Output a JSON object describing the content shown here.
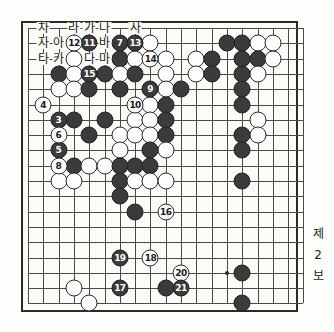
{
  "figure": {
    "caption_lines": [
      "제",
      "2",
      "보"
    ],
    "board": {
      "columns": 18,
      "rows": 19,
      "grid_spacing": 15.3,
      "origin_x": 28,
      "origin_y": 28,
      "star_points": [
        [
          13,
          16
        ]
      ]
    }
  },
  "colors": {
    "black_stone": "#3b3b3b",
    "white_stone": "#fdfdfd",
    "line": "#4a4a4a",
    "border": "#2a2a2a",
    "paper": "#fbfbf8",
    "text": "#1d1d1d"
  },
  "board_letters": [
    {
      "label": "차",
      "col": 1,
      "row": 0
    },
    {
      "label": "라",
      "col": 3,
      "row": 0
    },
    {
      "label": "가",
      "col": 4,
      "row": 0
    },
    {
      "label": "나",
      "col": 5,
      "row": 0
    },
    {
      "label": "사",
      "col": 7,
      "row": 0
    },
    {
      "label": "자",
      "col": 1,
      "row": 1
    },
    {
      "label": "아",
      "col": 2,
      "row": 1
    },
    {
      "label": "바",
      "col": 5,
      "row": 1
    },
    {
      "label": "타",
      "col": 1,
      "row": 2
    },
    {
      "label": "카",
      "col": 2,
      "row": 2
    },
    {
      "label": "다",
      "col": 4,
      "row": 2
    },
    {
      "label": "마",
      "col": 5,
      "row": 2
    }
  ],
  "numbered_moves": [
    {
      "n": "3",
      "color": "b",
      "col": 2,
      "row": 6
    },
    {
      "n": "4",
      "color": "w",
      "col": 1,
      "row": 5
    },
    {
      "n": "5",
      "color": "b",
      "col": 2,
      "row": 8
    },
    {
      "n": "6",
      "color": "w",
      "col": 2,
      "row": 7
    },
    {
      "n": "7",
      "color": "b",
      "col": 6,
      "row": 1
    },
    {
      "n": "8",
      "color": "w",
      "col": 2,
      "row": 9
    },
    {
      "n": "9",
      "color": "b",
      "col": 8,
      "row": 4
    },
    {
      "n": "10",
      "color": "w",
      "col": 7,
      "row": 5
    },
    {
      "n": "11",
      "color": "b",
      "col": 4,
      "row": 1
    },
    {
      "n": "12",
      "color": "w",
      "col": 3,
      "row": 1
    },
    {
      "n": "13",
      "color": "b",
      "col": 7,
      "row": 1
    },
    {
      "n": "14",
      "color": "w",
      "col": 8,
      "row": 2
    },
    {
      "n": "15",
      "color": "b",
      "col": 4,
      "row": 3
    },
    {
      "n": "16",
      "color": "w",
      "col": 9,
      "row": 12
    },
    {
      "n": "17",
      "color": "b",
      "col": 6,
      "row": 17
    },
    {
      "n": "18",
      "color": "w",
      "col": 8,
      "row": 15
    },
    {
      "n": "19",
      "color": "b",
      "col": 6,
      "row": 15
    },
    {
      "n": "20",
      "color": "w",
      "col": 10,
      "row": 16
    },
    {
      "n": "21",
      "color": "b",
      "col": 10,
      "row": 17
    }
  ],
  "plain_stones": [
    {
      "color": "w",
      "col": 8,
      "row": 1
    },
    {
      "color": "b",
      "col": 13,
      "row": 1
    },
    {
      "color": "b",
      "col": 14,
      "row": 1
    },
    {
      "color": "w",
      "col": 15,
      "row": 1
    },
    {
      "color": "w",
      "col": 16,
      "row": 1
    },
    {
      "color": "w",
      "col": 3,
      "row": 2
    },
    {
      "color": "b",
      "col": 6,
      "row": 2
    },
    {
      "color": "w",
      "col": 7,
      "row": 2
    },
    {
      "color": "w",
      "col": 9,
      "row": 2
    },
    {
      "color": "w",
      "col": 11,
      "row": 2
    },
    {
      "color": "b",
      "col": 12,
      "row": 2
    },
    {
      "color": "b",
      "col": 14,
      "row": 2
    },
    {
      "color": "b",
      "col": 15,
      "row": 2
    },
    {
      "color": "w",
      "col": 16,
      "row": 2
    },
    {
      "color": "b",
      "col": 2,
      "row": 3
    },
    {
      "color": "w",
      "col": 3,
      "row": 3
    },
    {
      "color": "b",
      "col": 5,
      "row": 3
    },
    {
      "color": "w",
      "col": 6,
      "row": 3
    },
    {
      "color": "b",
      "col": 7,
      "row": 3
    },
    {
      "color": "w",
      "col": 9,
      "row": 3
    },
    {
      "color": "w",
      "col": 11,
      "row": 3
    },
    {
      "color": "b",
      "col": 12,
      "row": 3
    },
    {
      "color": "b",
      "col": 14,
      "row": 3
    },
    {
      "color": "w",
      "col": 15,
      "row": 3
    },
    {
      "color": "w",
      "col": 2,
      "row": 4
    },
    {
      "color": "w",
      "col": 3,
      "row": 4
    },
    {
      "color": "b",
      "col": 4,
      "row": 4
    },
    {
      "color": "b",
      "col": 6,
      "row": 4
    },
    {
      "color": "w",
      "col": 9,
      "row": 4
    },
    {
      "color": "b",
      "col": 10,
      "row": 4
    },
    {
      "color": "b",
      "col": 14,
      "row": 4
    },
    {
      "color": "w",
      "col": 8,
      "row": 5
    },
    {
      "color": "b",
      "col": 9,
      "row": 5
    },
    {
      "color": "b",
      "col": 14,
      "row": 5
    },
    {
      "color": "b",
      "col": 3,
      "row": 6
    },
    {
      "color": "b",
      "col": 5,
      "row": 6
    },
    {
      "color": "w",
      "col": 7,
      "row": 6
    },
    {
      "color": "w",
      "col": 8,
      "row": 6
    },
    {
      "color": "b",
      "col": 9,
      "row": 6
    },
    {
      "color": "w",
      "col": 15,
      "row": 6
    },
    {
      "color": "b",
      "col": 4,
      "row": 7
    },
    {
      "color": "w",
      "col": 6,
      "row": 7
    },
    {
      "color": "w",
      "col": 7,
      "row": 7
    },
    {
      "color": "w",
      "col": 8,
      "row": 7
    },
    {
      "color": "b",
      "col": 9,
      "row": 7
    },
    {
      "color": "b",
      "col": 14,
      "row": 7
    },
    {
      "color": "w",
      "col": 15,
      "row": 7
    },
    {
      "color": "w",
      "col": 6,
      "row": 8
    },
    {
      "color": "b",
      "col": 8,
      "row": 8
    },
    {
      "color": "w",
      "col": 9,
      "row": 8
    },
    {
      "color": "b",
      "col": 14,
      "row": 8
    },
    {
      "color": "b",
      "col": 3,
      "row": 9
    },
    {
      "color": "w",
      "col": 4,
      "row": 9
    },
    {
      "color": "w",
      "col": 5,
      "row": 9
    },
    {
      "color": "b",
      "col": 6,
      "row": 9
    },
    {
      "color": "b",
      "col": 7,
      "row": 9
    },
    {
      "color": "b",
      "col": 8,
      "row": 9
    },
    {
      "color": "w",
      "col": 2,
      "row": 10
    },
    {
      "color": "w",
      "col": 3,
      "row": 10
    },
    {
      "color": "b",
      "col": 6,
      "row": 10
    },
    {
      "color": "w",
      "col": 7,
      "row": 10
    },
    {
      "color": "w",
      "col": 8,
      "row": 10
    },
    {
      "color": "w",
      "col": 9,
      "row": 10
    },
    {
      "color": "b",
      "col": 14,
      "row": 10
    },
    {
      "color": "b",
      "col": 6,
      "row": 11
    },
    {
      "color": "b",
      "col": 7,
      "row": 12
    },
    {
      "color": "b",
      "col": 14,
      "row": 16
    },
    {
      "color": "w",
      "col": 3,
      "row": 17
    },
    {
      "color": "b",
      "col": 9,
      "row": 17
    },
    {
      "color": "w",
      "col": 4,
      "row": 18
    },
    {
      "color": "b",
      "col": 14,
      "row": 18
    }
  ]
}
